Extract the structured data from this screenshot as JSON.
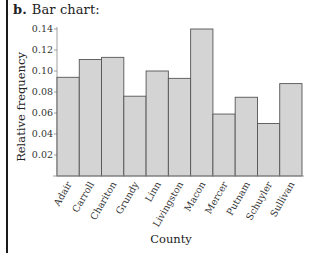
{
  "panel": {
    "tag": "b.",
    "title": "Bar chart:"
  },
  "colors": {
    "bar_fill": "#d4d4d4",
    "bar_stroke": "#555555",
    "axis": "#888888",
    "rule": "#1a1a1a"
  },
  "chart_data": {
    "type": "bar",
    "title": "Bar chart:",
    "xlabel": "County",
    "ylabel": "Relative frequency",
    "categories": [
      "Adair",
      "Carroll",
      "Chariton",
      "Grundy",
      "Linn",
      "Livingston",
      "Macon",
      "Mercer",
      "Putnam",
      "Schuyler",
      "Sullivan"
    ],
    "values": [
      0.094,
      0.111,
      0.113,
      0.076,
      0.1,
      0.093,
      0.14,
      0.059,
      0.075,
      0.05,
      0.088
    ],
    "yticks": [
      "0.02",
      "0.04",
      "0.06",
      "0.08",
      "0.10",
      "0.12",
      "0.14"
    ],
    "ylim": [
      0,
      0.14
    ],
    "grid": false,
    "legend": null,
    "x_tick_rotation": -60
  }
}
